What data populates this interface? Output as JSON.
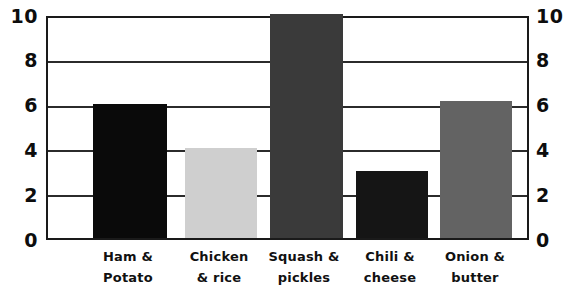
{
  "chart_data": {
    "type": "bar",
    "title": "",
    "subtitle": "",
    "xlabel": "",
    "ylabel": "",
    "ylim": [
      0,
      10
    ],
    "grid": true,
    "legend": false,
    "legend_position": "none",
    "y_ticks": [
      "0",
      "2",
      "4",
      "6",
      "8",
      "10"
    ],
    "y_tick_values": [
      0,
      2,
      4,
      6,
      8,
      10
    ],
    "dual_axis": true,
    "right_y_ticks": [
      "0",
      "2",
      "4",
      "6",
      "8",
      "10"
    ],
    "categories": [
      "Ham & Potato",
      "Chicken & rice",
      "Squash & pickles",
      "Chili & cheese",
      "Onion & butter"
    ],
    "category_lines": [
      [
        "Ham &",
        "Potato"
      ],
      [
        "Chicken",
        "& rice"
      ],
      [
        "Squash &",
        "pickles"
      ],
      [
        "Chili &",
        "cheese"
      ],
      [
        "Onion &",
        "butter"
      ]
    ],
    "values": [
      6,
      4,
      10,
      3,
      6.1
    ],
    "bar_colors": [
      "#0a0a0a",
      "#cfcfcf",
      "#3a3a3a",
      "#151515",
      "#636363"
    ],
    "axis_color": "#1a1a1a",
    "grid_color": "#2b2b2b",
    "background_color": "#ffffff",
    "bars": [
      {
        "label": "Ham & Potato",
        "value": 6,
        "color": "#0a0a0a"
      },
      {
        "label": "Chicken & rice",
        "value": 4,
        "color": "#cfcfcf"
      },
      {
        "label": "Squash & pickles",
        "value": 10,
        "color": "#3a3a3a"
      },
      {
        "label": "Chili & cheese",
        "value": 3,
        "color": "#151515"
      },
      {
        "label": "Onion & butter",
        "value": 6.1,
        "color": "#636363"
      }
    ]
  },
  "layout": {
    "plot": {
      "left": 46,
      "top": 16,
      "width": 483,
      "height": 224
    },
    "bar_slots": [
      {
        "left": 45,
        "width": 74
      },
      {
        "left": 137,
        "width": 72
      },
      {
        "left": 222,
        "width": 73
      },
      {
        "left": 308,
        "width": 72
      },
      {
        "left": 392,
        "width": 72
      }
    ],
    "label_slots": [
      {
        "left": 30,
        "width": 104
      },
      {
        "left": 122,
        "width": 102
      },
      {
        "left": 205,
        "width": 106
      },
      {
        "left": 293,
        "width": 102
      },
      {
        "left": 378,
        "width": 102
      }
    ]
  }
}
